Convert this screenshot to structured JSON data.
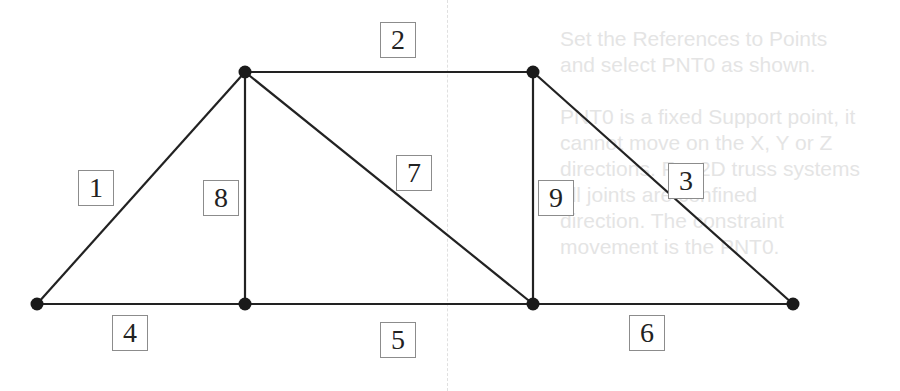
{
  "diagram": {
    "type": "truss",
    "colors": {
      "member": "#222222",
      "node": "#1a1a1a",
      "label_border": "#8c8c8c",
      "bleed_text": "#cfcfcf"
    },
    "nodes": [
      {
        "id": "A",
        "x": 37,
        "y": 304
      },
      {
        "id": "B",
        "x": 245,
        "y": 72
      },
      {
        "id": "C",
        "x": 245,
        "y": 304
      },
      {
        "id": "D",
        "x": 533,
        "y": 72
      },
      {
        "id": "E",
        "x": 533,
        "y": 304
      },
      {
        "id": "F",
        "x": 793,
        "y": 304
      }
    ],
    "members": [
      {
        "label": "1",
        "from": "A",
        "to": "B",
        "lx": 78,
        "ly": 170
      },
      {
        "label": "2",
        "from": "B",
        "to": "D",
        "lx": 380,
        "ly": 22
      },
      {
        "label": "3",
        "from": "D",
        "to": "F",
        "lx": 668,
        "ly": 163
      },
      {
        "label": "4",
        "from": "A",
        "to": "C",
        "lx": 112,
        "ly": 315
      },
      {
        "label": "5",
        "from": "C",
        "to": "E",
        "lx": 380,
        "ly": 322
      },
      {
        "label": "6",
        "from": "E",
        "to": "F",
        "lx": 629,
        "ly": 315
      },
      {
        "label": "7",
        "from": "B",
        "to": "E",
        "lx": 396,
        "ly": 155
      },
      {
        "label": "8",
        "from": "B",
        "to": "C",
        "lx": 203,
        "ly": 180
      },
      {
        "label": "9",
        "from": "D",
        "to": "E",
        "lx": 538,
        "ly": 180
      }
    ]
  },
  "bleed_through": {
    "lines": [
      "Set the References to Points",
      "and select PNT0 as shown.",
      "",
      "PNT0 is a fixed Support point, it",
      "cannot move on the X, Y or Z",
      "directions. For 2D truss systems",
      "all joints are confined",
      "direction. The constraint",
      "movement is the PNT0."
    ]
  }
}
